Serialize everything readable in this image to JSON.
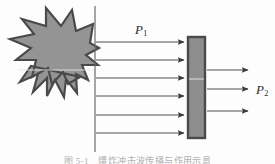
{
  "figure": {
    "title_label_incident": "P",
    "title_label_incident_sub": "1",
    "title_label_transmitted": "P",
    "title_label_transmitted_sub": "2",
    "caption": "图 5-1　爆炸冲击波传播与作用示意",
    "colors": {
      "background": "#fdfdfd",
      "blast_fill": "#949494",
      "blast_stroke": "#4a4a4a",
      "barrier_fill": "#8e8e8e",
      "barrier_stroke": "#4a4a4a",
      "arrow": "#3a3a3a",
      "divider_line": "#6b6b6b",
      "label_text": "#2b2b2b",
      "caption_text": "#6f6f6f"
    },
    "elements": {
      "blast_star_name": "explosion-starburst",
      "divider_line_name": "vertical-reference-line",
      "barrier_name": "barrier-plate",
      "incident_arrow_count": 6,
      "transmitted_arrow_count": 3
    },
    "geometry": {
      "blast_star_points": "80,77 57,86 64,69 40,77 49,59 25,57 43,45 14,33 45,32 29,17 55,26 52,6 69,27 79,13 81,33 98,25 92,44 80,48 92,54 78,61 86,69",
      "divider_x": 95,
      "divider_y_top": 6,
      "divider_y_bottom": 152,
      "barrier_x": 188,
      "barrier_y": 37,
      "barrier_w": 17,
      "barrier_h": 101,
      "incident_arrow_x_start": 96,
      "incident_arrow_x_end": 186,
      "incident_arrow_ys": [
        42,
        60,
        78,
        96,
        115,
        133
      ],
      "transmitted_arrow_x_start": 207,
      "transmitted_arrow_x_end": 250,
      "transmitted_arrow_ys": [
        70,
        89,
        111
      ]
    }
  }
}
